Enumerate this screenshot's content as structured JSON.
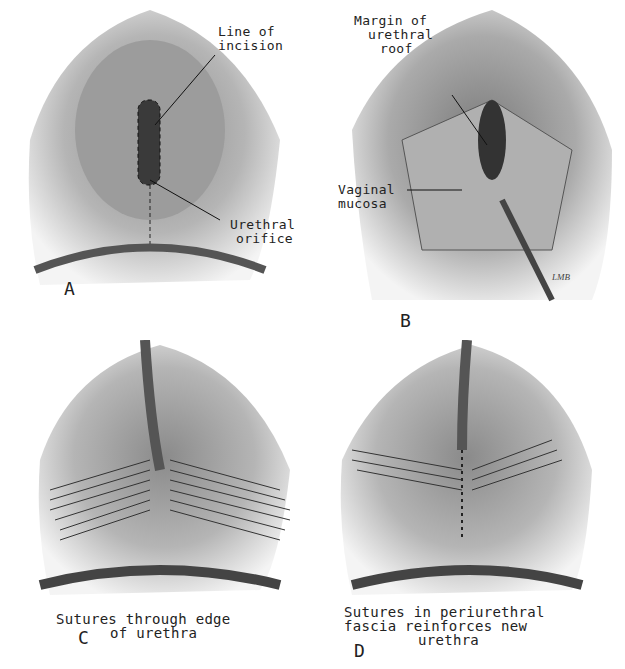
{
  "figure": {
    "panels": [
      {
        "id": "A",
        "letter": "A",
        "labels": [
          {
            "text_line1": "Line of",
            "text_line2": "incision"
          },
          {
            "text_line1": "Urethral",
            "text_line2": "orifice"
          }
        ]
      },
      {
        "id": "B",
        "letter": "B",
        "labels": [
          {
            "text_line1": "Margin of",
            "text_line2": "urethral",
            "text_line3": "roof"
          },
          {
            "text_line1": "Vaginal",
            "text_line2": "mucosa"
          }
        ]
      },
      {
        "id": "C",
        "letter": "C",
        "caption_line1": "Sutures through edge",
        "caption_line2": "of urethra"
      },
      {
        "id": "D",
        "letter": "D",
        "caption_line1": "Sutures in periurethral",
        "caption_line2": "fascia reinforces new",
        "caption_line3": "urethra"
      }
    ]
  }
}
